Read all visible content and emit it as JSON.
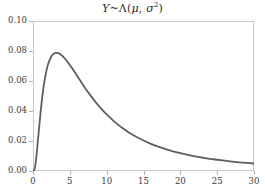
{
  "chart_data": {
    "type": "line",
    "title_parts": {
      "variable": "Y",
      "tilde": "~",
      "distribution": "Λ",
      "open_paren": "(",
      "mu": "μ",
      "comma": ", ",
      "sigma": "σ",
      "exponent": "2",
      "close_paren": ")"
    },
    "subtitle": "",
    "xlabel": "",
    "ylabel": "",
    "xlim": [
      0,
      30
    ],
    "ylim": [
      0.0,
      0.1
    ],
    "xticks": [
      0,
      5,
      10,
      15,
      20,
      25,
      30
    ],
    "xtick_labels": [
      "0",
      "5",
      "10",
      "15",
      "20",
      "25",
      "30"
    ],
    "yticks": [
      0.0,
      0.02,
      0.04,
      0.06,
      0.08,
      0.1
    ],
    "ytick_labels": [
      "0.00",
      "0.02",
      "0.04",
      "0.06",
      "0.08",
      "0.10"
    ],
    "grid": false,
    "legend": false,
    "legend_position": "none",
    "curve_color": "#5e5e5e",
    "frame_color": "#c9c9c9",
    "axis_text_color": "#3a3a3a",
    "background": "#ffffff",
    "line_width": 1.8,
    "distribution_name": "lognormal",
    "parameters": {
      "mu": 1.8,
      "sigma": 0.9
    },
    "peak": {
      "x": 2.8,
      "y": 0.089
    },
    "series": [
      {
        "name": "lognormal-pdf",
        "x": [
          0,
          0.15,
          0.3,
          0.45,
          0.6,
          0.8,
          1.0,
          1.2,
          1.4,
          1.6,
          1.8,
          2.0,
          2.2,
          2.4,
          2.6,
          2.8,
          3.0,
          3.2,
          3.4,
          3.6,
          3.8,
          4.0,
          4.5,
          5.0,
          5.5,
          6.0,
          6.5,
          7.0,
          7.5,
          8.0,
          8.5,
          9.0,
          9.5,
          10.0,
          11.0,
          12.0,
          13.0,
          14.0,
          15.0,
          16.0,
          17.0,
          18.0,
          19.0,
          20.0,
          21.0,
          22.0,
          23.0,
          24.0,
          25.0,
          26.0,
          27.0,
          28.0,
          29.0,
          30.0
        ],
        "y": [
          0.0,
          0.0003,
          0.0032,
          0.0091,
          0.0167,
          0.0273,
          0.0378,
          0.0471,
          0.0549,
          0.0613,
          0.0664,
          0.0704,
          0.0734,
          0.0756,
          0.0772,
          0.0782,
          0.0787,
          0.0788,
          0.0786,
          0.0782,
          0.0775,
          0.0767,
          0.074,
          0.0707,
          0.0671,
          0.0633,
          0.0596,
          0.0559,
          0.0524,
          0.0491,
          0.0459,
          0.043,
          0.0403,
          0.0377,
          0.0331,
          0.0291,
          0.0257,
          0.0228,
          0.0203,
          0.0181,
          0.0162,
          0.0146,
          0.0131,
          0.0119,
          0.0108,
          0.0098,
          0.0089,
          0.0081,
          0.0075,
          0.0069,
          0.0063,
          0.0058,
          0.0054,
          0.005
        ]
      }
    ]
  }
}
